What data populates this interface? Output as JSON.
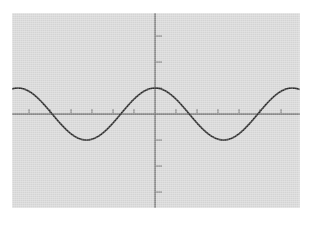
{
  "app": {
    "title": "Graphing Calculator Screen",
    "screen_width": 310,
    "screen_height": 225,
    "background_color": "#ffffff"
  },
  "plot": {
    "panel_color": "#d9d9d9",
    "panel_left": 12,
    "panel_top": 13,
    "panel_width": 288,
    "panel_height": 195,
    "axis_color": "#6f6f6f",
    "curve_color": "#2b2b2b",
    "tick_color": "#8a8a8a",
    "origin_x_px": 155,
    "origin_y_px": 114,
    "x_tick_spacing_px": 21,
    "y_tick_spacing_px": 26,
    "x_tick_length_px": 5,
    "y_tick_length_px": 7
  },
  "chart_data": {
    "type": "line",
    "title": "",
    "subtitle": "",
    "xlabel": "",
    "ylabel": "",
    "grid": false,
    "legend": null,
    "annotations": [],
    "axes": {
      "x_axis_visible": true,
      "y_axis_visible": true,
      "x_tick_labels": [],
      "y_tick_labels": [],
      "x_tick_count": 13,
      "y_tick_count": 7,
      "xlim": [
        -6.6,
        6.6
      ],
      "ylim": [
        -4.5,
        4.5
      ],
      "x_tick_step": 1,
      "y_tick_step": 1
    },
    "series": [
      {
        "name": "y = cos(x)",
        "function": "cos",
        "amplitude": 1,
        "period_units": 6.2832,
        "phase": 0,
        "vertical_shift": 0,
        "peaks_x": [
          -6.283,
          0,
          6.283
        ],
        "troughs_x": [
          -3.142,
          3.142
        ],
        "zeros_x": [
          -4.712,
          -1.571,
          1.571,
          4.712
        ],
        "x": [
          -6.6,
          -6.2,
          -5.8,
          -5.4,
          -5.0,
          -4.6,
          -4.2,
          -3.8,
          -3.4,
          -3.0,
          -2.6,
          -2.2,
          -1.8,
          -1.4,
          -1.0,
          -0.6,
          -0.2,
          0.2,
          0.6,
          1.0,
          1.4,
          1.8,
          2.2,
          2.6,
          3.0,
          3.4,
          3.8,
          4.2,
          4.6,
          5.0,
          5.4,
          5.8,
          6.2,
          6.6
        ],
        "y": [
          0.95,
          1.0,
          0.89,
          0.63,
          0.28,
          -0.11,
          -0.49,
          -0.79,
          -0.97,
          -0.99,
          -0.86,
          -0.59,
          -0.23,
          0.17,
          0.54,
          0.83,
          0.98,
          0.98,
          0.83,
          0.54,
          0.17,
          -0.23,
          -0.59,
          -0.86,
          -0.99,
          -0.97,
          -0.79,
          -0.49,
          -0.11,
          0.28,
          0.63,
          0.89,
          1.0,
          0.95
        ]
      }
    ]
  }
}
